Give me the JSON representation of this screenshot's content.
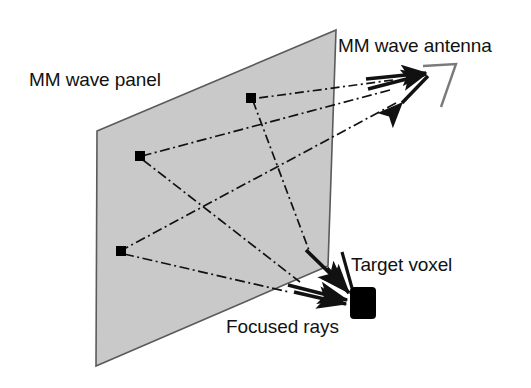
{
  "figure": {
    "title_visible": false,
    "background_color": "#ffffff",
    "panel_fill_color": "#c9c9c9",
    "panel_stroke_color": "#555555",
    "ray_color": "#111111",
    "voxel_color": "#000000",
    "antenna_outline_color": "#666666"
  },
  "labels": {
    "panel": "MM wave panel",
    "antenna": "MM wave antenna",
    "voxel": "Target voxel",
    "rays": "Focused rays"
  },
  "icons": {
    "panel_surface": "mm-wave-panel-surface",
    "antenna": "horn-antenna-icon",
    "voxel": "target-voxel-icon",
    "reflector_element": "panel-reflector-element"
  },
  "geometry": {
    "panel_corners": [
      {
        "x": 97,
        "y": 131
      },
      {
        "x": 336,
        "y": 30
      },
      {
        "x": 328,
        "y": 266
      },
      {
        "x": 96,
        "y": 366
      }
    ],
    "reflector_elements": [
      {
        "id": "element-top",
        "x": 251,
        "y": 98
      },
      {
        "id": "element-middle",
        "x": 140,
        "y": 156
      },
      {
        "id": "element-bottom",
        "x": 121,
        "y": 251
      }
    ],
    "antenna_feed_points": [
      {
        "x": 396,
        "y": 79
      },
      {
        "x": 392,
        "y": 89
      },
      {
        "x": 398,
        "y": 102
      }
    ],
    "antenna_apex": {
      "x": 432,
      "y": 72
    },
    "target_voxel": {
      "x": 352,
      "y": 294,
      "width": 26,
      "height": 30
    }
  }
}
